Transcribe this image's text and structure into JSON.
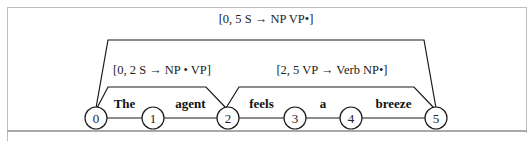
{
  "diagram": {
    "type": "chart-parse",
    "words": [
      "The",
      "agent",
      "feels",
      "a",
      "breeze"
    ],
    "nodes": [
      "0",
      "1",
      "2",
      "3",
      "4",
      "5"
    ],
    "arcs": [
      {
        "from": 0,
        "to": 5,
        "label": "[0, 5 S → NP VP•]",
        "level": 2
      },
      {
        "from": 0,
        "to": 2,
        "label": "[0, 2 S → NP • VP]",
        "level": 1
      },
      {
        "from": 2,
        "to": 5,
        "label": "[2, 5 VP → Verb NP•]",
        "level": 1
      }
    ],
    "colors": {
      "stroke": "#1a1a1a",
      "frame": "#bdbdbd"
    }
  }
}
